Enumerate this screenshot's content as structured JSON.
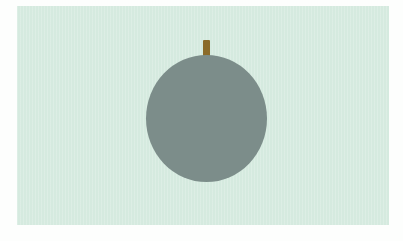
{
  "figure": {
    "background_color": "#d5eadf",
    "fruit": {
      "shape": "circle",
      "color": "#7c8d8a"
    },
    "stem": {
      "color": "#8b6b2a"
    }
  }
}
